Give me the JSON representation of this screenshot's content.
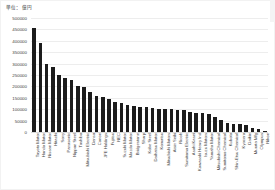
{
  "chart_data": {
    "type": "bar",
    "title": "",
    "subtitle": "",
    "unit_label": "単位：億円",
    "xlabel": "",
    "ylabel": "",
    "ylim": [
      0,
      500000
    ],
    "ytick_step": 50000,
    "grid": true,
    "legend": false,
    "legend_position": "none",
    "bar_color": "#1c1c1c",
    "orientation": "vertical",
    "sorted": "descending",
    "yticks": [
      "0",
      "50000",
      "100000",
      "150000",
      "200000",
      "250000",
      "300000",
      "350000",
      "400000",
      "450000",
      "500000"
    ],
    "ytick_values": [
      0,
      50000,
      100000,
      150000,
      200000,
      250000,
      300000,
      350000,
      400000,
      450000,
      500000
    ],
    "categories": [
      "Toyota Motor",
      "Honda Motor",
      "Nissan Motor",
      "Hitachi",
      "Sony",
      "Panasonic",
      "Nippon Steel",
      "Toshiba",
      "Mitsubishi Electric",
      "Denso",
      "Canon",
      "JFE Holdings",
      "Fujitsu",
      "NEC",
      "Suzuki Motor",
      "Mazda Motor",
      "Bridgestone",
      "Sharp",
      "Kobe Steel",
      "Daihatsu Motor",
      "Komatsu",
      "Mitsubishi Motors",
      "Aisin Seiki",
      "Ricoh",
      "Sumitomo Electric",
      "Asahi Kasei",
      "Kawasaki Heavy Ind",
      "Isuzu Motors",
      "Yamaha Motor",
      "Mitsubishi Chemical",
      "Sumitomo Chemical",
      "Kubota",
      "Shin-Etsu Chemical",
      "Kyocera",
      "Daikin",
      "Murata Mfg",
      "Olympus",
      "Nikon"
    ],
    "values": [
      455000,
      392000,
      297000,
      283000,
      252000,
      237000,
      228000,
      200000,
      199000,
      175000,
      158000,
      153000,
      144000,
      132000,
      127000,
      118000,
      114000,
      111000,
      110000,
      105000,
      103000,
      101000,
      99000,
      97000,
      95000,
      88000,
      85000,
      83000,
      78000,
      67000,
      52000,
      39000,
      35000,
      33000,
      30000,
      19000,
      12000,
      4000
    ]
  }
}
